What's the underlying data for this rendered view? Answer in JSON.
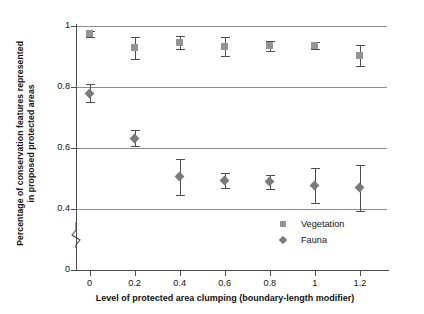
{
  "chart_data": {
    "type": "scatter",
    "title": "",
    "xlabel": "Level of protected area clumping (boundary-length modifier)",
    "ylabel_line1": "Percentage of conservation features represented",
    "ylabel_line2": "in proposed protected areas",
    "x": [
      0,
      0.2,
      0.4,
      0.6,
      0.8,
      1,
      1.2
    ],
    "xticklabels": [
      "0",
      "0.2",
      "0.4",
      "0.6",
      "0.8",
      "1",
      "1.2"
    ],
    "yticklabels": [
      "0",
      "0.4",
      "0.6",
      "0.8",
      "1"
    ],
    "ytickvalues": [
      0,
      0.4,
      0.6,
      0.8,
      1
    ],
    "ylim": [
      0,
      1
    ],
    "xlim": [
      -0.06,
      1.32
    ],
    "grid": "horizontal",
    "axis_break": true,
    "axis_break_between": [
      0,
      0.4
    ],
    "legend_position": "inside-bottom-right",
    "series": [
      {
        "name": "Vegetation",
        "marker": "square",
        "color": "#949494",
        "values": [
          0.975,
          0.928,
          0.945,
          0.933,
          0.935,
          0.936,
          0.903
        ],
        "err_low": [
          0.01,
          0.036,
          0.022,
          0.03,
          0.016,
          0.012,
          0.035
        ],
        "err_high": [
          0.01,
          0.036,
          0.022,
          0.03,
          0.016,
          0.012,
          0.035
        ]
      },
      {
        "name": "Fauna",
        "marker": "diamond",
        "color": "#7a7a7a",
        "values": [
          0.78,
          0.632,
          0.505,
          0.494,
          0.489,
          0.477,
          0.47
        ],
        "err_low": [
          0.03,
          0.026,
          0.06,
          0.025,
          0.022,
          0.058,
          0.075
        ],
        "err_high": [
          0.03,
          0.026,
          0.06,
          0.025,
          0.022,
          0.058,
          0.075
        ]
      }
    ]
  },
  "legend": {
    "items": [
      {
        "label": "Vegetation",
        "marker": "square-marker-icon"
      },
      {
        "label": "Fauna",
        "marker": "diamond-marker-icon"
      }
    ]
  }
}
